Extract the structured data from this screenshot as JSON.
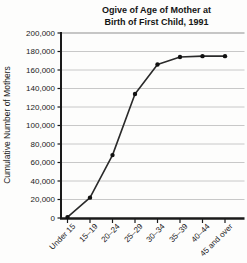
{
  "title": {
    "line1": "Ogive of Age of Mother at",
    "line2": "Birth of First Child, 1991"
  },
  "chart_data": {
    "type": "line",
    "title": "Ogive of Age of Mother at Birth of First Child, 1991",
    "subtitle": "",
    "xlabel": "",
    "ylabel": "Cumulative Number of Mothers",
    "categories": [
      "Under 15",
      "15–19",
      "20–24",
      "25–29",
      "30–34",
      "35–39",
      "40–44",
      "45 and over"
    ],
    "values": [
      1000,
      22000,
      68000,
      134000,
      166000,
      174000,
      175000,
      175000
    ],
    "ylim": [
      0,
      200000
    ],
    "ytick_step": 20000,
    "ytick_labels": [
      "0",
      "20,000",
      "40,000",
      "60,000",
      "80,000",
      "100,000",
      "120,000",
      "140,000",
      "160,000",
      "180,000",
      "200,000"
    ],
    "grid": true,
    "legend_position": "none",
    "line_color": "#2a2a2a",
    "marker_color": "#111111",
    "grid_color": "#c8c8c8",
    "axis_color": "#1a1a1a"
  }
}
